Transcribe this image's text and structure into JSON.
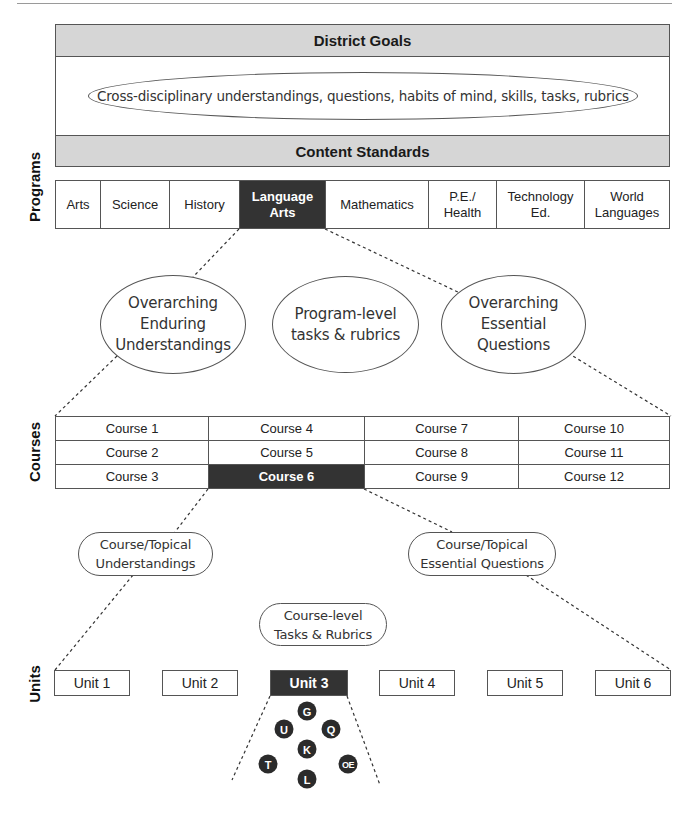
{
  "district": {
    "goals_label": "District Goals",
    "cross_disciplinary": "Cross-disciplinary understandings, questions, habits of mind, skills, tasks, rubrics",
    "content_standards_label": "Content Standards"
  },
  "levels": {
    "programs": "Programs",
    "courses": "Courses",
    "units": "Units"
  },
  "programs": [
    {
      "label": "Arts",
      "selected": false
    },
    {
      "label": "Science",
      "selected": false
    },
    {
      "label": "History",
      "selected": false
    },
    {
      "label": "Language\nArts",
      "selected": true
    },
    {
      "label": "Mathematics",
      "selected": false
    },
    {
      "label": "P.E./\nHealth",
      "selected": false
    },
    {
      "label": "Technology\nEd.",
      "selected": false
    },
    {
      "label": "World\nLanguages",
      "selected": false
    }
  ],
  "program_level": {
    "enduring": "Overarching\nEnduring\nUnderstandings",
    "tasks": "Program-level\ntasks & rubrics",
    "questions": "Overarching\nEssential\nQuestions"
  },
  "courses": {
    "rows": [
      [
        "Course 1",
        "Course 4",
        "Course 7",
        "Course 10"
      ],
      [
        "Course 2",
        "Course 5",
        "Course 8",
        "Course 11"
      ],
      [
        "Course 3",
        "Course 6",
        "Course 9",
        "Course 12"
      ]
    ],
    "selected": "Course 6"
  },
  "course_level": {
    "understandings": "Course/Topical\nUnderstandings",
    "questions": "Course/Topical\nEssential Questions",
    "tasks": "Course-level\nTasks & Rubrics"
  },
  "units": [
    {
      "label": "Unit 1",
      "selected": false
    },
    {
      "label": "Unit 2",
      "selected": false
    },
    {
      "label": "Unit 3",
      "selected": true
    },
    {
      "label": "Unit 4",
      "selected": false
    },
    {
      "label": "Unit 5",
      "selected": false
    },
    {
      "label": "Unit 6",
      "selected": false
    }
  ],
  "unit_elements": {
    "g": "G",
    "u": "U",
    "q": "Q",
    "k": "K",
    "t": "T",
    "oe": "OE",
    "l": "L"
  },
  "colors": {
    "selected_fill": "#333333",
    "band_fill": "#d6d6d6",
    "border": "#555555"
  }
}
